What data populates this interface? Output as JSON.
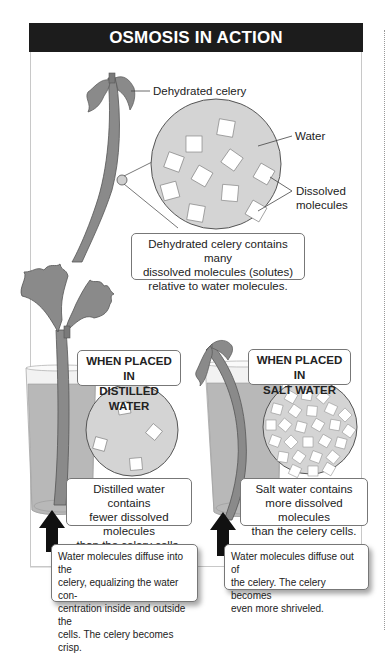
{
  "title": "OSMOSIS IN ACTION",
  "top_section": {
    "labels": {
      "celery": "Dehydrated celery",
      "water": "Water",
      "dissolved_line1": "Dissolved",
      "dissolved_line2": "molecules"
    },
    "caption": [
      "Dehydrated celery contains many",
      "dissolved molecules (solutes)",
      "relative to water molecules."
    ]
  },
  "panels": [
    {
      "heading": [
        "WHEN PLACED IN",
        "DISTILLED WATER"
      ],
      "caption": [
        "Distilled water contains",
        "fewer dissolved molecules",
        "than the celery cells."
      ],
      "note": [
        "Water molecules diffuse into the",
        "celery, equalizing the water con-",
        "centration inside and outside the",
        "cells. The celery becomes crisp."
      ],
      "arrow": "arrow-up-icon"
    },
    {
      "heading": [
        "WHEN PLACED IN",
        "SALT WATER"
      ],
      "caption": [
        "Salt water contains",
        "more dissolved molecules",
        "than the celery cells."
      ],
      "note": [
        "Water molecules diffuse out of",
        "the celery. The celery becomes",
        "even more shriveled."
      ],
      "arrow": "arrow-up-icon"
    }
  ],
  "colors": {
    "header_bg": "#1c1c1c",
    "celery": "#8a8a8a",
    "water_circle": "#d4d4d4",
    "glass_water": "#b8b8b8",
    "border": "#777777"
  }
}
